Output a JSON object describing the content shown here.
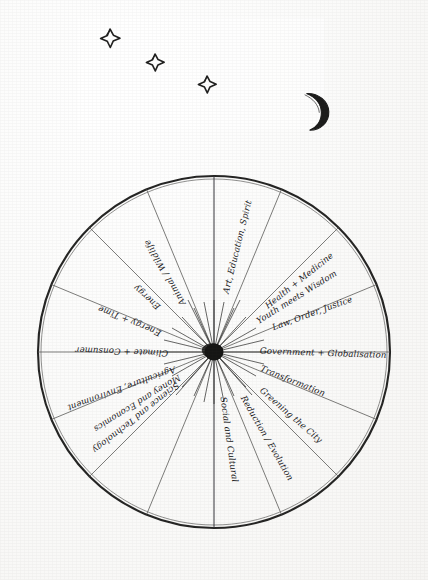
{
  "document": {
    "kind": "hand-drawn pen sketch on paper",
    "title": "Wheel of Themes",
    "background_color": "#fdfdfc",
    "ink_color": "#20201f"
  },
  "sky": {
    "name": "night-sky vignette",
    "moon": {
      "name": "crescent-moon",
      "cx": 313,
      "cy": 108,
      "r": 15
    },
    "stars": [
      {
        "name": "star-1",
        "cx": 110,
        "cy": 38,
        "r": 9
      },
      {
        "name": "star-2",
        "cx": 155,
        "cy": 62,
        "r": 8
      },
      {
        "name": "star-3",
        "cx": 207,
        "cy": 84,
        "r": 8
      }
    ]
  },
  "wheel": {
    "name": "radial-theme-wheel",
    "center_x": 214,
    "center_y": 202,
    "radius": 176,
    "hub_radius": 9,
    "spoke_count": 16,
    "labels": [
      "Art, Education, Spirit",
      "Youth meets Wisdom",
      "Health + Medicine",
      "Law, Order, Justice",
      "Government + Globalisation",
      "Transformation",
      "Greening the City",
      "Reduction / Evolution",
      "Social and Cultural",
      "Money and Economics",
      "Science and Technology",
      "Agriculture, Environment",
      "Climate + Consumer",
      "Energy + Time",
      "Energy",
      "Animal / Wildlife"
    ],
    "label_angles_deg": [
      -76,
      -58,
      -40,
      -20,
      2,
      22,
      41,
      60,
      82,
      104,
      126,
      148,
      170,
      192,
      214,
      248
    ]
  }
}
